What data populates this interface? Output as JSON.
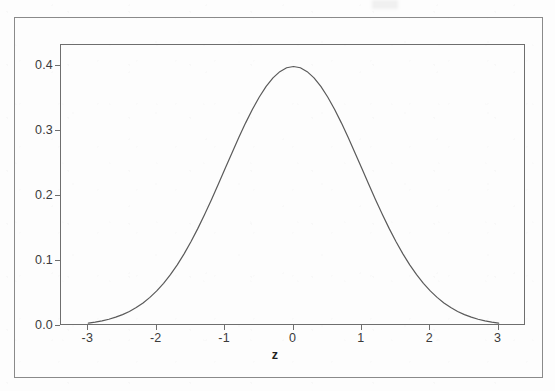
{
  "figure": {
    "background_color": "#fdfdfd",
    "ink_color": "#5a5a5a",
    "outer_border_color": "#8a8a8a",
    "plot_frame_color": "#6e6e6e",
    "axis_title": "z"
  },
  "chart_data": {
    "type": "line",
    "title": "",
    "subtitle": "",
    "xlabel": "z",
    "ylabel": "",
    "xlim": [
      -3.4,
      3.4
    ],
    "ylim": [
      0.0,
      0.432
    ],
    "grid": false,
    "legend": null,
    "legend_position": "none",
    "curve_color": "#5a5a5a",
    "curve_width": 1.2,
    "xticks": [
      -3,
      -2,
      -1,
      0,
      1,
      2,
      3
    ],
    "xticklabels": [
      "-3",
      "-2",
      "-1",
      "0",
      "1",
      "2",
      "3"
    ],
    "yticks": [
      0.0,
      0.1,
      0.2,
      0.3,
      0.4
    ],
    "yticklabels": [
      "0.0",
      "0.1",
      "0.2",
      "0.3",
      "0.4"
    ],
    "peak": {
      "x": 0,
      "y": 0.3989
    },
    "series": [
      {
        "name": "standard normal pdf",
        "x": [
          -3.0,
          -2.9,
          -2.8,
          -2.7,
          -2.6,
          -2.5,
          -2.4,
          -2.3,
          -2.2,
          -2.1,
          -2.0,
          -1.9,
          -1.8,
          -1.7,
          -1.6,
          -1.5,
          -1.4,
          -1.3,
          -1.2,
          -1.1,
          -1.0,
          -0.9,
          -0.8,
          -0.7,
          -0.6,
          -0.5,
          -0.4,
          -0.3,
          -0.2,
          -0.1,
          0.0,
          0.1,
          0.2,
          0.3,
          0.4,
          0.5,
          0.6,
          0.7,
          0.8,
          0.9,
          1.0,
          1.1,
          1.2,
          1.3,
          1.4,
          1.5,
          1.6,
          1.7,
          1.8,
          1.9,
          2.0,
          2.1,
          2.2,
          2.3,
          2.4,
          2.5,
          2.6,
          2.7,
          2.8,
          2.9,
          3.0
        ],
        "y": [
          0.0044,
          0.006,
          0.0079,
          0.0104,
          0.0136,
          0.0175,
          0.0224,
          0.0283,
          0.0355,
          0.044,
          0.054,
          0.0656,
          0.079,
          0.094,
          0.1109,
          0.1295,
          0.1497,
          0.1714,
          0.1942,
          0.2179,
          0.242,
          0.2661,
          0.2897,
          0.3123,
          0.3332,
          0.3521,
          0.3683,
          0.3814,
          0.391,
          0.397,
          0.3989,
          0.397,
          0.391,
          0.3814,
          0.3683,
          0.3521,
          0.3332,
          0.3123,
          0.2897,
          0.2661,
          0.242,
          0.2179,
          0.1942,
          0.1714,
          0.1497,
          0.1295,
          0.1109,
          0.094,
          0.079,
          0.0656,
          0.054,
          0.044,
          0.0355,
          0.0283,
          0.0224,
          0.0175,
          0.0136,
          0.0104,
          0.0079,
          0.006,
          0.0044
        ]
      }
    ]
  }
}
